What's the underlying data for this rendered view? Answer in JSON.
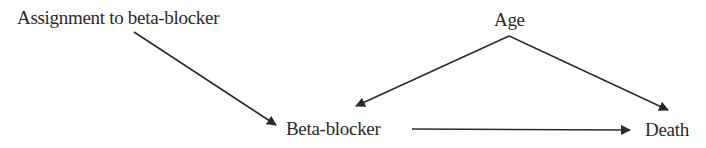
{
  "diagram": {
    "type": "causal-dag",
    "nodes": [
      {
        "id": "assignment",
        "label": "Assignment to beta-blocker"
      },
      {
        "id": "age",
        "label": "Age"
      },
      {
        "id": "beta",
        "label": "Beta-blocker"
      },
      {
        "id": "death",
        "label": "Death"
      }
    ],
    "edges": [
      {
        "from": "assignment",
        "to": "beta"
      },
      {
        "from": "age",
        "to": "beta"
      },
      {
        "from": "age",
        "to": "death"
      },
      {
        "from": "beta",
        "to": "death"
      }
    ],
    "colors": {
      "line": "#2a2a2a",
      "background": "#ffffff"
    }
  }
}
